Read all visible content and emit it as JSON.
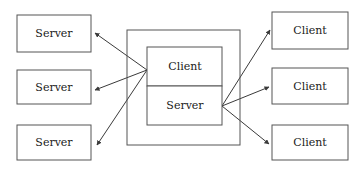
{
  "diagram": {
    "canvas": {
      "width": 364,
      "height": 173,
      "background": "#ffffff"
    },
    "style": {
      "box_stroke": "#555555",
      "line_stroke": "#3a3a3a",
      "text_color": "#1a1a1a"
    },
    "left_nodes": [
      {
        "label": "Server",
        "x": 17,
        "y": 15,
        "w": 74,
        "h": 37
      },
      {
        "label": "Server",
        "x": 17,
        "y": 70,
        "w": 74,
        "h": 34
      },
      {
        "label": "Server",
        "x": 17,
        "y": 125,
        "w": 74,
        "h": 35
      }
    ],
    "right_nodes": [
      {
        "label": "Client",
        "x": 272,
        "y": 12,
        "w": 76,
        "h": 37
      },
      {
        "label": "Client",
        "x": 272,
        "y": 68,
        "w": 76,
        "h": 36
      },
      {
        "label": "Client",
        "x": 272,
        "y": 125,
        "w": 76,
        "h": 35
      }
    ],
    "center": {
      "outer": {
        "x": 127,
        "y": 30,
        "w": 113,
        "h": 115
      },
      "inner": {
        "x": 147,
        "y": 47,
        "w": 75,
        "h": 78
      },
      "upper_half": {
        "label": "Client",
        "x": 147,
        "y": 47,
        "w": 75,
        "h": 39
      },
      "lower_half": {
        "label": "Server",
        "x": 147,
        "y": 86,
        "w": 75,
        "h": 39
      }
    },
    "hubs": {
      "left_hub": {
        "x": 147,
        "y": 70
      },
      "right_hub": {
        "x": 222,
        "y": 106
      }
    },
    "edges": [
      {
        "from": "left-hub",
        "to": "server-1",
        "direction": "to-node",
        "x1": 147,
        "y1": 70,
        "x2": 93,
        "y2": 33
      },
      {
        "from": "left-hub",
        "to": "server-2",
        "direction": "bidirectional",
        "x1": 147,
        "y1": 70,
        "x2": 93,
        "y2": 90
      },
      {
        "from": "left-hub",
        "to": "server-3",
        "direction": "bidirectional",
        "x1": 147,
        "y1": 70,
        "x2": 95,
        "y2": 143
      },
      {
        "from": "right-hub",
        "to": "client-1",
        "direction": "bidirectional",
        "x1": 222,
        "y1": 106,
        "x2": 271,
        "y2": 31
      },
      {
        "from": "right-hub",
        "to": "client-2",
        "direction": "bidirectional",
        "x1": 222,
        "y1": 106,
        "x2": 270,
        "y2": 88
      },
      {
        "from": "right-hub",
        "to": "client-3",
        "direction": "bidirectional",
        "x1": 222,
        "y1": 106,
        "x2": 270,
        "y2": 143
      }
    ]
  }
}
